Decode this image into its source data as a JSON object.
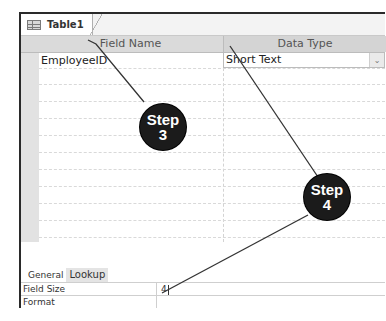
{
  "window": {
    "tab_label": "Table1",
    "tab_icon": "table-icon"
  },
  "grid": {
    "headers": {
      "field_name": "Field Name",
      "data_type": "Data Type"
    },
    "rows": [
      {
        "field_name": "EmployeeID",
        "data_type": "Short Text"
      }
    ],
    "dropdown_icon": "chevron-down-icon"
  },
  "properties": {
    "tabs": [
      {
        "label": "General",
        "active": true
      },
      {
        "label": "Lookup",
        "active": false
      }
    ],
    "rows": [
      {
        "label": "Field Size",
        "value": "4"
      },
      {
        "label": "Format",
        "value": ""
      }
    ]
  },
  "callouts": [
    {
      "word": "Step",
      "number": "3"
    },
    {
      "word": "Step",
      "number": "4"
    }
  ],
  "colors": {
    "badge_bg": "#1b1b1b",
    "badge_text": "#ffffff",
    "header_bg": "#dadada",
    "selector_bg": "#e2e2e2"
  }
}
